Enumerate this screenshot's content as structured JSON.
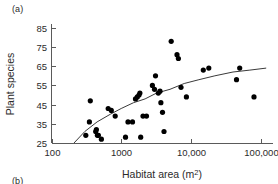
{
  "figure": {
    "panel_a_label": "(a)",
    "panel_b_label": "(b)"
  },
  "chart_data": {
    "type": "scatter",
    "title": "",
    "subtitle": "",
    "xlabel": "Habitat area (m2)",
    "xlabel_base": "Habitat area (m",
    "xlabel_sup": "2",
    "xlabel_tail": ")",
    "ylabel": "Plant species",
    "xscale": "log",
    "yscale": "linear",
    "xlim": [
      100,
      150000
    ],
    "ylim": [
      25,
      87
    ],
    "grid": false,
    "legend": false,
    "xticks": [
      100,
      1000,
      10000,
      100000
    ],
    "xticklabels": [
      "100",
      "1000",
      "10,000",
      "100,000"
    ],
    "yticks": [
      25,
      35,
      45,
      55,
      65,
      75,
      85
    ],
    "yticklabels": [
      "25",
      "35",
      "45",
      "55",
      "65",
      "75",
      "85"
    ],
    "marker": "filled-circle",
    "marker_color": "#000000",
    "curve_color": "#3a3a3a",
    "points": [
      {
        "x": 310,
        "y": 29
      },
      {
        "x": 350,
        "y": 36
      },
      {
        "x": 360,
        "y": 47
      },
      {
        "x": 430,
        "y": 31
      },
      {
        "x": 440,
        "y": 32
      },
      {
        "x": 455,
        "y": 29
      },
      {
        "x": 470,
        "y": 29
      },
      {
        "x": 520,
        "y": 27
      },
      {
        "x": 650,
        "y": 43
      },
      {
        "x": 720,
        "y": 42
      },
      {
        "x": 820,
        "y": 39
      },
      {
        "x": 1150,
        "y": 28
      },
      {
        "x": 1250,
        "y": 36
      },
      {
        "x": 1450,
        "y": 36
      },
      {
        "x": 1600,
        "y": 48
      },
      {
        "x": 1700,
        "y": 49
      },
      {
        "x": 1800,
        "y": 50
      },
      {
        "x": 1850,
        "y": 51
      },
      {
        "x": 1900,
        "y": 28
      },
      {
        "x": 2050,
        "y": 39
      },
      {
        "x": 2300,
        "y": 39
      },
      {
        "x": 2800,
        "y": 55
      },
      {
        "x": 3000,
        "y": 53
      },
      {
        "x": 3100,
        "y": 60
      },
      {
        "x": 3400,
        "y": 51
      },
      {
        "x": 3600,
        "y": 52
      },
      {
        "x": 3700,
        "y": 46
      },
      {
        "x": 3900,
        "y": 41
      },
      {
        "x": 4100,
        "y": 31
      },
      {
        "x": 5200,
        "y": 78
      },
      {
        "x": 6300,
        "y": 71
      },
      {
        "x": 6600,
        "y": 69
      },
      {
        "x": 7200,
        "y": 54
      },
      {
        "x": 8600,
        "y": 49
      },
      {
        "x": 15000,
        "y": 63
      },
      {
        "x": 18000,
        "y": 64
      },
      {
        "x": 45000,
        "y": 58
      },
      {
        "x": 50000,
        "y": 64
      },
      {
        "x": 80000,
        "y": 49
      }
    ],
    "fit_curve": {
      "description": "logarithmic species-area fit",
      "points": [
        {
          "x": 210,
          "y": 25
        },
        {
          "x": 300,
          "y": 31
        },
        {
          "x": 450,
          "y": 36
        },
        {
          "x": 700,
          "y": 40
        },
        {
          "x": 1000,
          "y": 43
        },
        {
          "x": 1500,
          "y": 46
        },
        {
          "x": 2200,
          "y": 48
        },
        {
          "x": 3200,
          "y": 51
        },
        {
          "x": 5000,
          "y": 53
        },
        {
          "x": 8000,
          "y": 56
        },
        {
          "x": 13000,
          "y": 58
        },
        {
          "x": 22000,
          "y": 60
        },
        {
          "x": 40000,
          "y": 62
        },
        {
          "x": 70000,
          "y": 63
        },
        {
          "x": 120000,
          "y": 64
        }
      ]
    }
  }
}
